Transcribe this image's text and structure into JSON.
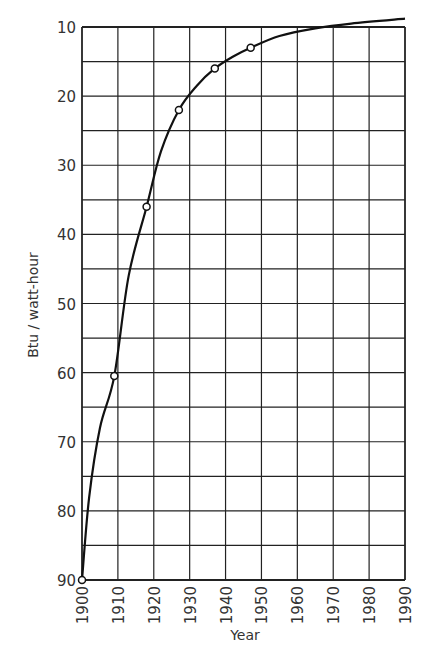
{
  "chart_data": {
    "type": "line",
    "title": "",
    "xlabel": "Year",
    "ylabel": "Btu / watt-hour",
    "xlim": [
      1900,
      1990
    ],
    "ylim": [
      90,
      10
    ],
    "y_inverted": true,
    "grid": true,
    "legend": null,
    "x_ticks": [
      "1900",
      "1910",
      "1920",
      "1930",
      "1940",
      "1950",
      "1960",
      "1970",
      "1980",
      "1990"
    ],
    "y_ticks": [
      "10",
      "20",
      "30",
      "40",
      "50",
      "60",
      "70",
      "80",
      "90"
    ],
    "markers": {
      "x": [
        1900,
        1909,
        1918,
        1927,
        1937,
        1947
      ],
      "y": [
        90,
        60.5,
        36,
        22,
        16,
        13
      ]
    },
    "series": [
      {
        "name": "Heat rate",
        "x": [
          1900,
          1902,
          1905,
          1909,
          1913,
          1918,
          1922,
          1927,
          1932,
          1937,
          1942,
          1947,
          1955,
          1965,
          1975,
          1990
        ],
        "y": [
          90,
          78,
          68,
          60.5,
          46,
          36,
          28,
          22,
          18.5,
          16,
          14.3,
          13,
          11.3,
          10.2,
          9.5,
          8.8
        ]
      }
    ]
  }
}
